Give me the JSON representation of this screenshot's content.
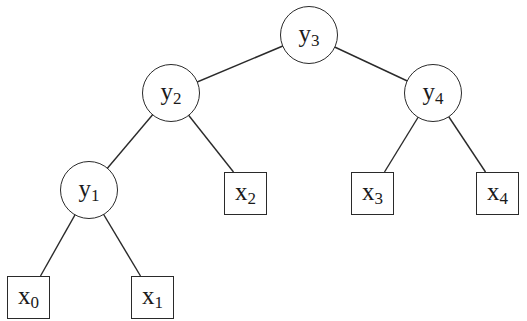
{
  "diagram": {
    "type": "binary-tree",
    "internal_nodes": [
      {
        "id": "y3",
        "base": "y",
        "sub": "3",
        "cx": 309,
        "cy": 35,
        "r": 29
      },
      {
        "id": "y2",
        "base": "y",
        "sub": "2",
        "cx": 171,
        "cy": 93,
        "r": 29
      },
      {
        "id": "y4",
        "base": "y",
        "sub": "4",
        "cx": 433,
        "cy": 93,
        "r": 29
      },
      {
        "id": "y1",
        "base": "y",
        "sub": "1",
        "cx": 89,
        "cy": 190,
        "r": 29
      }
    ],
    "leaf_nodes": [
      {
        "id": "x0",
        "base": "x",
        "sub": "0",
        "x": 7,
        "y": 276,
        "w": 43,
        "h": 43
      },
      {
        "id": "x1",
        "base": "x",
        "sub": "1",
        "x": 131,
        "y": 276,
        "w": 43,
        "h": 43
      },
      {
        "id": "x2",
        "base": "x",
        "sub": "2",
        "x": 224,
        "y": 172,
        "w": 43,
        "h": 43
      },
      {
        "id": "x3",
        "base": "x",
        "sub": "3",
        "x": 351,
        "y": 172,
        "w": 43,
        "h": 43
      },
      {
        "id": "x4",
        "base": "x",
        "sub": "4",
        "x": 476,
        "y": 172,
        "w": 43,
        "h": 43
      }
    ],
    "edges": [
      [
        "y3",
        "y2"
      ],
      [
        "y3",
        "y4"
      ],
      [
        "y2",
        "y1"
      ],
      [
        "y2",
        "x2"
      ],
      [
        "y4",
        "x3"
      ],
      [
        "y4",
        "x4"
      ],
      [
        "y1",
        "x0"
      ],
      [
        "y1",
        "x1"
      ]
    ]
  }
}
